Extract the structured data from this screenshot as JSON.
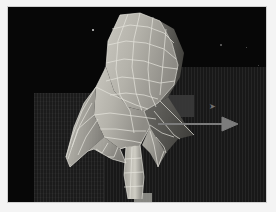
{
  "app": {
    "kind": "3d-modeling-viewport",
    "title": "3D Viewport",
    "render_mode": "solid-shaded-wireframe"
  },
  "viewport": {
    "background_color": "#070707",
    "ground_color": "#1b1b1b",
    "grid_visible": true,
    "grid_style": "fine vertical scanlines"
  },
  "model": {
    "name": "organic-creature-mesh",
    "description": "Low-poly wing / fin creature form with quad wireframe overlay",
    "surface_color": "#b8b6ae",
    "surface_shadow_color": "#5a5954",
    "wireframe_color": "#e6e4dc",
    "wireframe_visible": true,
    "selected": true
  },
  "gizmo": {
    "name": "translate-arrow",
    "axis": "X",
    "direction": "right",
    "color": "#6e6e6e",
    "x": 170,
    "y": 117,
    "length": 58
  },
  "cursor": {
    "glyph": "➤",
    "x": 201,
    "y": 96
  },
  "frame": {
    "border_color": "#cfcfcf",
    "page_background": "#f4f4f4"
  },
  "highlights": [
    {
      "name": "vertex-dot-top-left",
      "x": 84,
      "y": 22,
      "size": 2
    },
    {
      "name": "vertex-dot-upper-right",
      "x": 212,
      "y": 37,
      "size": 2
    },
    {
      "name": "vertex-dot-right",
      "x": 238,
      "y": 40,
      "size": 1
    },
    {
      "name": "vertex-dot-lower-left",
      "x": 62,
      "y": 157,
      "size": 1
    },
    {
      "name": "vertex-dot-right-mid",
      "x": 250,
      "y": 58,
      "size": 1
    }
  ]
}
